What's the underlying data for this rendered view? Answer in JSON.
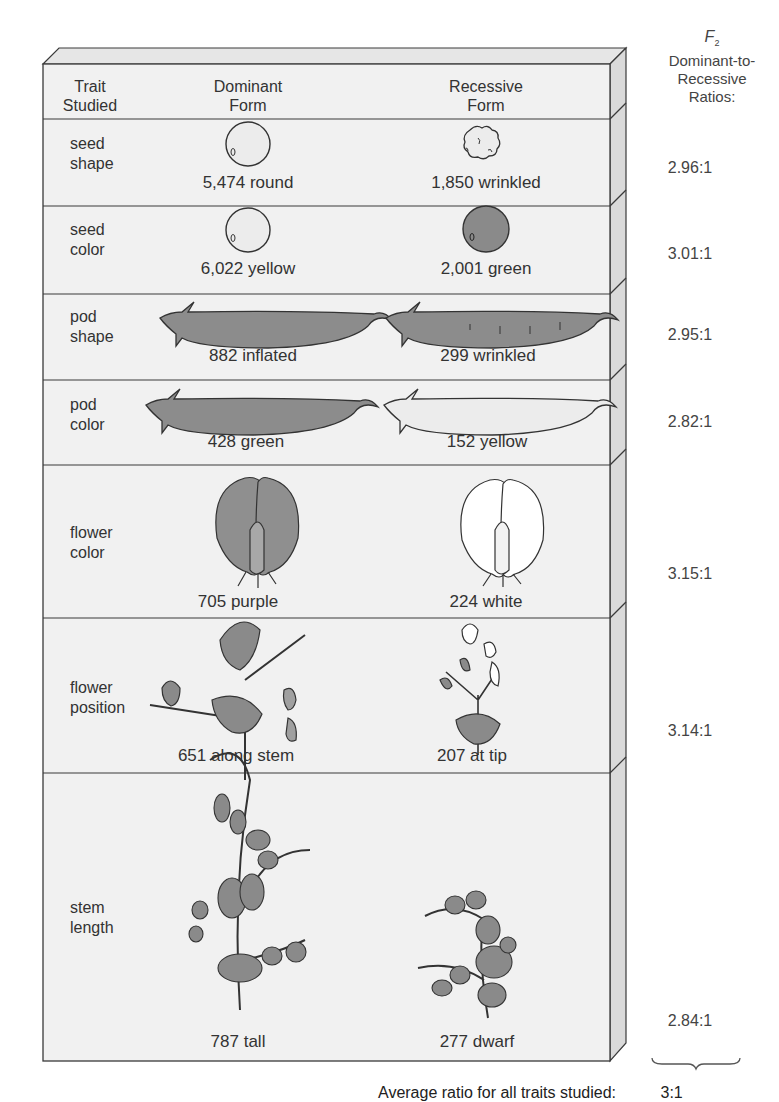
{
  "header": {
    "trait_col": [
      "Trait",
      "Studied"
    ],
    "dominant_col": [
      "Dominant",
      "Form"
    ],
    "recessive_col": [
      "Recessive",
      "Form"
    ],
    "ratio_col": {
      "symbol": "F",
      "subscript": "2",
      "lines": [
        "Dominant-to-",
        "Recessive",
        "Ratios:"
      ]
    }
  },
  "rows": [
    {
      "trait": [
        "seed",
        "shape"
      ],
      "dominant": "5,474 round",
      "recessive": "1,850 wrinkled",
      "ratio": "2.96:1",
      "dominant_icon": "round-seed-icon",
      "recessive_icon": "wrinkled-seed-icon"
    },
    {
      "trait": [
        "seed",
        "color"
      ],
      "dominant": "6,022 yellow",
      "recessive": "2,001 green",
      "ratio": "3.01:1",
      "dominant_icon": "yellow-seed-icon",
      "recessive_icon": "green-seed-icon"
    },
    {
      "trait": [
        "pod",
        "shape"
      ],
      "dominant": "882 inflated",
      "recessive": "299 wrinkled",
      "ratio": "2.95:1",
      "dominant_icon": "inflated-pod-icon",
      "recessive_icon": "wrinkled-pod-icon"
    },
    {
      "trait": [
        "pod",
        "color"
      ],
      "dominant": "428 green",
      "recessive": "152 yellow",
      "ratio": "2.82:1",
      "dominant_icon": "green-pod-icon",
      "recessive_icon": "yellow-pod-icon"
    },
    {
      "trait": [
        "flower",
        "color"
      ],
      "dominant": "705 purple",
      "recessive": "224 white",
      "ratio": "3.15:1",
      "dominant_icon": "purple-flower-icon",
      "recessive_icon": "white-flower-icon"
    },
    {
      "trait": [
        "flower",
        "position"
      ],
      "dominant": "651 along stem",
      "recessive": "207 at tip",
      "ratio": "3.14:1",
      "dominant_icon": "axial-flower-plant-icon",
      "recessive_icon": "terminal-flower-plant-icon"
    },
    {
      "trait": [
        "stem",
        "length"
      ],
      "dominant": "787 tall",
      "recessive": "277 dwarf",
      "ratio": "2.84:1",
      "dominant_icon": "tall-plant-icon",
      "recessive_icon": "dwarf-plant-icon"
    }
  ],
  "footer": {
    "caption": "Average ratio for all traits studied:",
    "average_ratio": "3:1"
  },
  "colors": {
    "panel_face": "#f1f1f1",
    "panel_side": "#dcdcdc",
    "outline": "#3a3a3a",
    "fill_dark": "#8c8c8c",
    "fill_light": "#ebebeb"
  }
}
